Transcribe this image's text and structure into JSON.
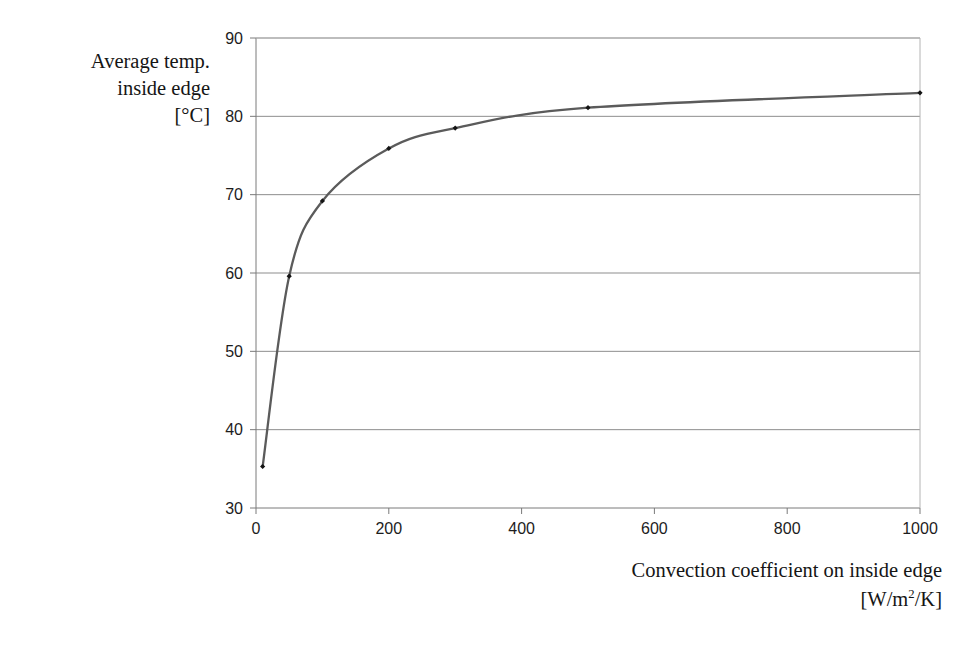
{
  "chart_data": {
    "type": "line",
    "title": "",
    "subtitle": "",
    "xlabel": "Convection coefficient on inside edge [W/m2/K]",
    "ylabel": "Average temp. inside edge [°C]",
    "xlim": [
      0,
      1000
    ],
    "ylim": [
      30,
      90
    ],
    "xticks": [
      0,
      200,
      400,
      600,
      800,
      1000
    ],
    "yticks": [
      30,
      40,
      50,
      60,
      70,
      80,
      90
    ],
    "xtick_labels": [
      "0",
      "200",
      "400",
      "600",
      "800",
      "1000"
    ],
    "ytick_labels": [
      "30",
      "40",
      "50",
      "60",
      "70",
      "80",
      "90"
    ],
    "grid": "horizontal",
    "legend": "none",
    "markers": "small filled diamond",
    "line_color": "#5b5b5b",
    "marker_color": "#141414",
    "gridline_color": "#8d8d8d",
    "axis_color": "#7a7a7a",
    "background": "#ffffff",
    "x": [
      10,
      50,
      100,
      200,
      300,
      500,
      1000
    ],
    "y": [
      35.3,
      59.6,
      69.2,
      75.9,
      78.5,
      81.1,
      83.0
    ],
    "series": [
      {
        "name": "Average temp. inside edge",
        "x": [
          10,
          50,
          100,
          200,
          300,
          500,
          1000
        ],
        "values": [
          35.3,
          59.6,
          69.2,
          75.9,
          78.5,
          81.1,
          83.0
        ]
      }
    ]
  },
  "axis_titles": {
    "y_line1": "Average temp.",
    "y_line2": "inside edge",
    "y_line3": "[°C]",
    "x_line1": "Convection coefficient on inside edge",
    "x_line2_prefix": "[W/m",
    "x_line2_sup": "2",
    "x_line2_suffix": "/K]"
  }
}
